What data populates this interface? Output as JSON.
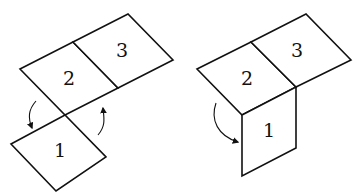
{
  "figures": [
    {
      "name": "unfolded",
      "faces": [
        {
          "label": "1"
        },
        {
          "label": "2"
        },
        {
          "label": "3"
        }
      ],
      "arrows": [
        {
          "direction": "down"
        },
        {
          "direction": "up"
        }
      ]
    },
    {
      "name": "folded",
      "faces": [
        {
          "label": "1"
        },
        {
          "label": "2"
        },
        {
          "label": "3"
        }
      ],
      "arrows": [
        {
          "direction": "down-right"
        }
      ]
    }
  ],
  "colors": {
    "stroke": "#111111",
    "background": "#ffffff"
  }
}
